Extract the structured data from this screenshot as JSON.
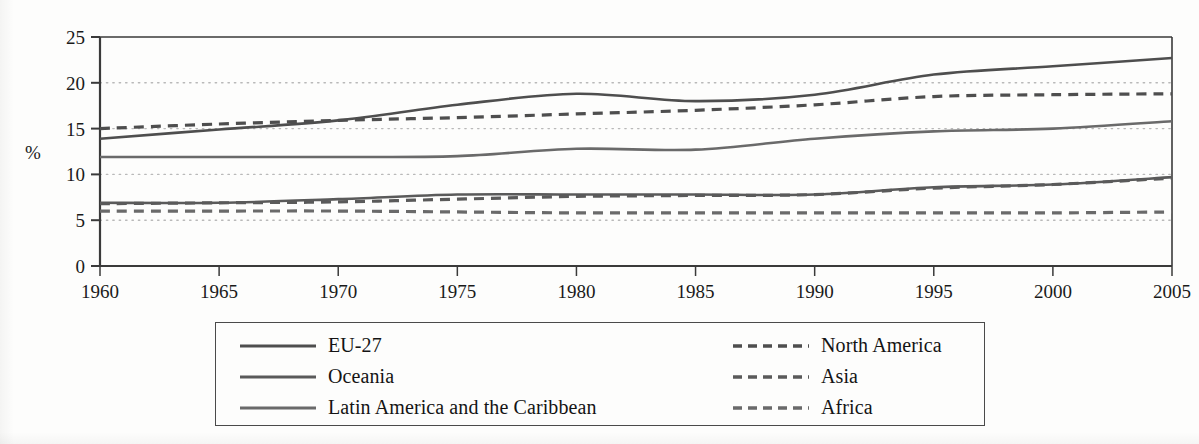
{
  "chart_data": {
    "type": "line",
    "title": "",
    "xlabel": "",
    "ylabel": "%",
    "xlim": [
      1960,
      2005
    ],
    "ylim": [
      0,
      25
    ],
    "grid": true,
    "gridlines_y": [
      5,
      10,
      15,
      20
    ],
    "legend_position": "bottom",
    "x": [
      1960,
      1965,
      1970,
      1975,
      1980,
      1985,
      1990,
      1995,
      2000,
      2005
    ],
    "xticks": [
      "1960",
      "1965",
      "1970",
      "1975",
      "1980",
      "1985",
      "1990",
      "1995",
      "2000",
      "2005"
    ],
    "yticks": [
      "0",
      "5",
      "10",
      "15",
      "20",
      "25"
    ],
    "series": [
      {
        "name": "EU-27",
        "style": "solid",
        "color": "#4e4e4e",
        "values": [
          13.9,
          14.9,
          15.9,
          17.6,
          18.8,
          18.0,
          18.7,
          20.9,
          21.8,
          22.7
        ]
      },
      {
        "name": "North America",
        "style": "dashed",
        "color": "#4e4e4e",
        "values": [
          15.0,
          15.5,
          15.9,
          16.2,
          16.6,
          17.0,
          17.6,
          18.5,
          18.7,
          18.8
        ]
      },
      {
        "name": "Oceania",
        "style": "solid",
        "color": "#5a5a5a",
        "values": [
          6.9,
          6.9,
          7.3,
          7.8,
          7.8,
          7.8,
          7.8,
          8.6,
          8.9,
          9.7
        ]
      },
      {
        "name": "Asia",
        "style": "dashed",
        "color": "#5a5a5a",
        "values": [
          6.8,
          6.9,
          7.0,
          7.3,
          7.6,
          7.7,
          7.8,
          8.5,
          8.9,
          9.6
        ]
      },
      {
        "name": "Latin America and the Caribbean",
        "style": "solid",
        "color": "#6a6a6a",
        "values": [
          11.9,
          11.9,
          11.9,
          12.0,
          12.8,
          12.7,
          13.9,
          14.7,
          15.0,
          15.8
        ]
      },
      {
        "name": "Africa",
        "style": "dashed",
        "color": "#6a6a6a",
        "values": [
          6.0,
          6.0,
          6.0,
          5.9,
          5.8,
          5.8,
          5.8,
          5.8,
          5.8,
          5.9
        ]
      }
    ]
  },
  "legend": {
    "entries": [
      {
        "label": "EU-27",
        "style": "solid",
        "column": "left"
      },
      {
        "label": "North America",
        "style": "dashed",
        "column": "right"
      },
      {
        "label": "Oceania",
        "style": "solid",
        "column": "left"
      },
      {
        "label": "Asia",
        "style": "dashed",
        "column": "right"
      },
      {
        "label": "Latin America and the Caribbean",
        "style": "solid",
        "column": "left"
      },
      {
        "label": "Africa",
        "style": "dashed",
        "column": "right"
      }
    ]
  },
  "colors": {
    "axis": "#3a3a3a",
    "gridline": "#b9b9b9",
    "text": "#141414",
    "background": "#fdfdfc"
  }
}
